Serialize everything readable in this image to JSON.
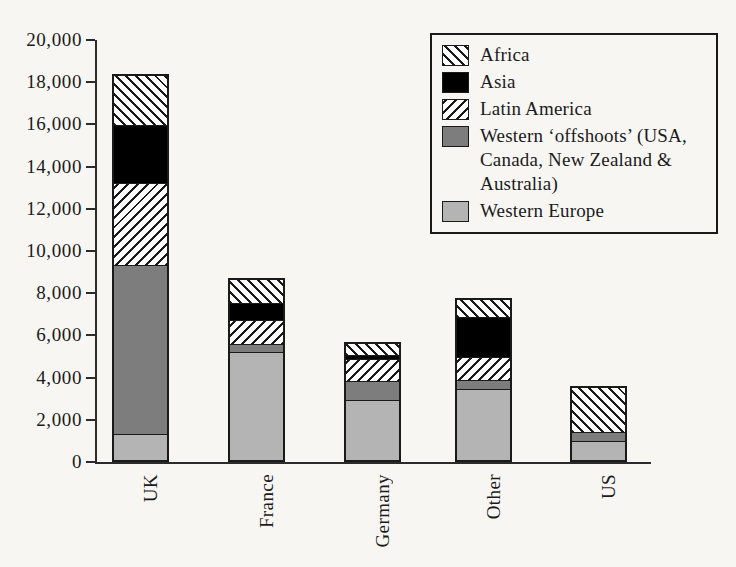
{
  "chart_data": {
    "type": "bar",
    "subtype": "stacked-vertical",
    "title": "",
    "xlabel": "",
    "ylabel": "",
    "ylim": [
      0,
      20000
    ],
    "grid": false,
    "categories": [
      "UK",
      "France",
      "Germany",
      "Other",
      "US"
    ],
    "y_ticks": [
      0,
      2000,
      4000,
      6000,
      8000,
      10000,
      12000,
      14000,
      16000,
      18000,
      20000
    ],
    "y_tick_labels": [
      "0",
      "2,000",
      "4,000",
      "6,000",
      "8,000",
      "10,000",
      "12,000",
      "14,000",
      "16,000",
      "18,000",
      "20,000"
    ],
    "legend_position": "top-right",
    "stack_order_bottom_to_top": [
      "Western Europe",
      "Western 'offshoots' (USA, Canada, New Zealand & Australia)",
      "Latin America",
      "Asia",
      "Africa"
    ],
    "series": [
      {
        "name": "Western Europe",
        "legend_label": "Western Europe",
        "fill": "light-gray",
        "color": "#b4b4b4",
        "values": [
          1230,
          5250,
          2930,
          3450,
          945
        ]
      },
      {
        "name": "Western 'offshoots'",
        "legend_label": "Western 'offshoots' (USA, Canada, New Zealand & Australia)",
        "fill": "dark-gray",
        "color": "#7d7d7d",
        "values": [
          8120,
          380,
          940,
          420,
          475
        ]
      },
      {
        "name": "Latin America",
        "legend_label": "Latin America",
        "fill": "backward-diagonal-hatch",
        "color": "#ffffff",
        "values": [
          3930,
          1130,
          1090,
          1140,
          0
        ]
      },
      {
        "name": "Asia",
        "legend_label": "Asia",
        "fill": "solid-black",
        "color": "#000000",
        "values": [
          2740,
          840,
          190,
          1940,
          0
        ]
      },
      {
        "name": "Africa",
        "legend_label": "Africa",
        "fill": "forward-diagonal-hatch",
        "color": "#ffffff",
        "values": [
          2380,
          1100,
          520,
          800,
          2170
        ]
      }
    ],
    "totals": [
      18400,
      8700,
      5670,
      7750,
      3590
    ]
  },
  "legend": {
    "items": [
      {
        "label": "Africa",
        "fill": "forward-diagonal-hatch"
      },
      {
        "label": "Asia",
        "fill": "solid-black"
      },
      {
        "label": "Latin America",
        "fill": "backward-diagonal-hatch"
      },
      {
        "label": "Western ‘offshoots’ (USA, Canada, New Zealand & Australia)",
        "fill": "dark-gray"
      },
      {
        "label": "Western Europe",
        "fill": "light-gray"
      }
    ]
  },
  "colors": {
    "axis": "#2b2b2b",
    "outline": "#1a1a1a",
    "background": "#f7f6f3",
    "asia": "#000000",
    "offshoots": "#7d7d7d",
    "western_europe": "#b4b4b4",
    "hatch_background": "#ffffff"
  }
}
